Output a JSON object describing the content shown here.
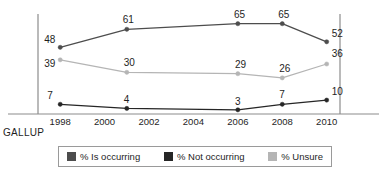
{
  "source": {
    "label": "GALLUP"
  },
  "chart_data": {
    "type": "line",
    "title": "",
    "xlabel": "",
    "ylabel": "",
    "grid": false,
    "legend_position": "bottom",
    "x": [
      1998,
      2001,
      2006,
      2008,
      2010
    ],
    "xlim": [
      1997,
      2010.6
    ],
    "ylim": [
      0,
      72
    ],
    "axis_ticks": [
      "1998",
      "2000",
      "2002",
      "2004",
      "2006",
      "2008",
      "2010"
    ],
    "axis_tick_values": [
      1998,
      2000,
      2002,
      2004,
      2006,
      2008,
      2010
    ],
    "series": [
      {
        "name": "% Is occurring",
        "color": "#4d4d4d",
        "values": [
          48,
          61,
          65,
          65,
          52
        ],
        "labels": [
          "48",
          "61",
          "65",
          "65",
          "52"
        ]
      },
      {
        "name": "% Not occurring",
        "color": "#262626",
        "values": [
          7,
          4,
          3,
          7,
          10
        ],
        "labels": [
          "7",
          "4",
          "3",
          "7",
          "10"
        ]
      },
      {
        "name": "% Unsure",
        "color": "#b5b5b5",
        "values": [
          39,
          30,
          29,
          26,
          36
        ],
        "labels": [
          "39",
          "30",
          "29",
          "26",
          "36"
        ]
      }
    ]
  },
  "legend": {
    "items": [
      {
        "label": "% Is occurring",
        "color": "#4d4d4d"
      },
      {
        "label": "% Not occurring",
        "color": "#262626"
      },
      {
        "label": "% Unsure",
        "color": "#b5b5b5"
      }
    ]
  }
}
